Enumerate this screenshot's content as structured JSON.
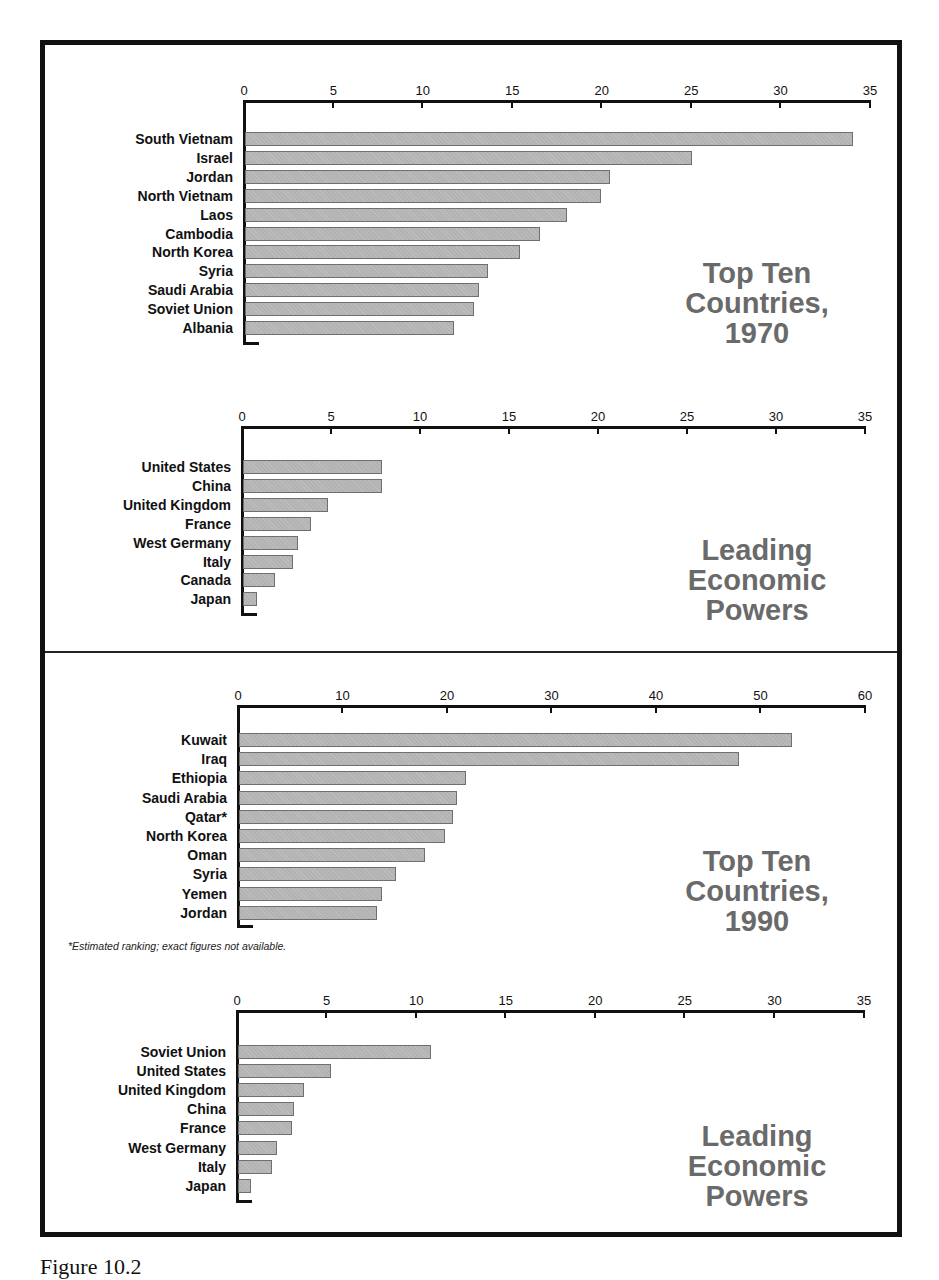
{
  "frame": {
    "border_color": "#111111"
  },
  "styles": {
    "bar_color": "#b3b3b3",
    "bar_border": "#6f6f6f",
    "title_color": "#6a6a6a"
  },
  "footnote": "*Estimated ranking; exact figures not available.",
  "caption": "Figure 10.2",
  "chart_data": [
    {
      "type": "bar",
      "orientation": "horizontal",
      "title": "Top Ten Countries, 1970",
      "title_lines": "Top Ten\nCountries,\n1970",
      "xlabel": "",
      "ylabel": "",
      "xlim": [
        0,
        35
      ],
      "ticks": [
        0,
        5,
        10,
        15,
        20,
        25,
        30,
        35
      ],
      "grid": false,
      "categories": [
        "South Vietnam",
        "Israel",
        "Jordan",
        "North Vietnam",
        "Laos",
        "Cambodia",
        "North Korea",
        "Syria",
        "Saudi Arabia",
        "Soviet Union",
        "Albania"
      ],
      "values": [
        34.0,
        25.0,
        20.4,
        19.9,
        18.0,
        16.5,
        15.4,
        13.6,
        13.1,
        12.8,
        11.7
      ]
    },
    {
      "type": "bar",
      "orientation": "horizontal",
      "title": "Leading Economic Powers",
      "title_lines": "Leading\nEconomic\nPowers",
      "xlabel": "",
      "ylabel": "",
      "xlim": [
        0,
        35
      ],
      "ticks": [
        0,
        5,
        10,
        15,
        20,
        25,
        30,
        35
      ],
      "grid": false,
      "categories": [
        "United States",
        "China",
        "United Kingdom",
        "France",
        "West Germany",
        "Italy",
        "Canada",
        "Japan"
      ],
      "values": [
        7.8,
        7.8,
        4.8,
        3.8,
        3.1,
        2.8,
        1.8,
        0.8
      ]
    },
    {
      "type": "bar",
      "orientation": "horizontal",
      "title": "Top Ten Countries, 1990",
      "title_lines": "Top Ten\nCountries,\n1990",
      "xlabel": "",
      "ylabel": "",
      "xlim": [
        0,
        60
      ],
      "ticks": [
        0,
        10,
        20,
        30,
        40,
        50,
        60
      ],
      "grid": false,
      "categories": [
        "Kuwait",
        "Iraq",
        "Ethiopia",
        "Saudi Arabia",
        "Qatar*",
        "North Korea",
        "Oman",
        "Syria",
        "Yemen",
        "Jordan"
      ],
      "values": [
        52.9,
        47.8,
        21.7,
        20.9,
        20.5,
        19.7,
        17.8,
        15.0,
        13.7,
        13.2
      ],
      "annotation": "*Estimated ranking; exact figures not available."
    },
    {
      "type": "bar",
      "orientation": "horizontal",
      "title": "Leading Economic Powers",
      "title_lines": "Leading\nEconomic\nPowers",
      "xlabel": "",
      "ylabel": "",
      "xlim": [
        0,
        35
      ],
      "ticks": [
        0,
        5,
        10,
        15,
        20,
        25,
        30,
        35
      ],
      "grid": false,
      "categories": [
        "Soviet Union",
        "United States",
        "United Kingdom",
        "China",
        "France",
        "West Germany",
        "Italy",
        "Japan"
      ],
      "values": [
        10.8,
        5.2,
        3.7,
        3.1,
        3.0,
        2.2,
        1.9,
        0.7
      ]
    }
  ]
}
